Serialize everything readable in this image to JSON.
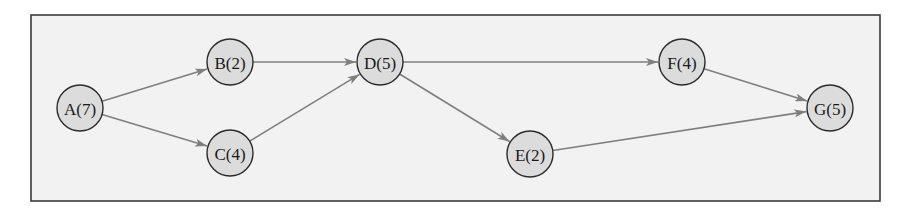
{
  "diagram": {
    "type": "directed-graph",
    "frame": {
      "x": 31,
      "y": 15,
      "width": 849,
      "height": 186
    },
    "colors": {
      "background": "#f2f2f2",
      "frame_border": "#3a3a3a",
      "node_fill": "#dcdcdc",
      "node_stroke": "#2b2b2b",
      "edge": "#7f7f7f",
      "text": "#1a1a1a"
    },
    "node_radius": 23,
    "nodes": [
      {
        "id": "A",
        "label": "A(7)",
        "duration": 7,
        "x": 80,
        "y": 108
      },
      {
        "id": "B",
        "label": "B(2)",
        "duration": 2,
        "x": 230,
        "y": 62
      },
      {
        "id": "C",
        "label": "C(4)",
        "duration": 4,
        "x": 230,
        "y": 153
      },
      {
        "id": "D",
        "label": "D(5)",
        "duration": 5,
        "x": 380,
        "y": 62
      },
      {
        "id": "E",
        "label": "E(2)",
        "duration": 2,
        "x": 530,
        "y": 154
      },
      {
        "id": "F",
        "label": "F(4)",
        "duration": 4,
        "x": 682,
        "y": 62
      },
      {
        "id": "G",
        "label": "G(5)",
        "duration": 5,
        "x": 830,
        "y": 108
      }
    ],
    "edges": [
      {
        "from": "A",
        "to": "B"
      },
      {
        "from": "A",
        "to": "C"
      },
      {
        "from": "B",
        "to": "D"
      },
      {
        "from": "C",
        "to": "D"
      },
      {
        "from": "D",
        "to": "F"
      },
      {
        "from": "D",
        "to": "E"
      },
      {
        "from": "F",
        "to": "G"
      },
      {
        "from": "E",
        "to": "G"
      }
    ]
  }
}
